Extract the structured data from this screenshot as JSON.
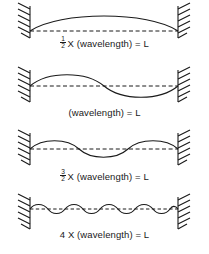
{
  "figure": {
    "background_color": "#ffffff",
    "line_color": "#1a1a1a",
    "width": 209,
    "height": 254
  },
  "panels": [
    {
      "id": "panel-half-wavelength",
      "lobes": 1,
      "wavelengths": 0.5,
      "amplitude_px": 16,
      "caption": {
        "fraction": {
          "numerator": "1",
          "denominator": "2"
        },
        "text": "X (wavelength) = L",
        "full": "1/2 X (wavelength) = L"
      },
      "left_wall": "hatched-wall-left",
      "right_wall": "hatched-wall-right"
    },
    {
      "id": "panel-one-wavelength",
      "lobes": 2,
      "wavelengths": 1,
      "amplitude_px": 13,
      "caption": {
        "fraction": null,
        "text": "(wavelength) = L",
        "full": "(wavelength) = L"
      },
      "left_wall": "hatched-wall-left",
      "right_wall": "hatched-wall-right"
    },
    {
      "id": "panel-three-halves-wavelength",
      "lobes": 3,
      "wavelengths": 1.5,
      "amplitude_px": 10,
      "caption": {
        "fraction": {
          "numerator": "3",
          "denominator": "2"
        },
        "text": "X (wavelength) = L",
        "full": "3/2 X (wavelength) = L"
      },
      "left_wall": "hatched-wall-left",
      "right_wall": "hatched-wall-right"
    },
    {
      "id": "panel-four-wavelengths",
      "lobes": 8,
      "wavelengths": 4,
      "amplitude_px": 5,
      "caption": {
        "fraction": null,
        "text": "4 X (wavelength) = L",
        "full": "4 X (wavelength) = L"
      },
      "left_wall": "hatched-wall-left",
      "right_wall": "hatched-wall-right"
    }
  ]
}
